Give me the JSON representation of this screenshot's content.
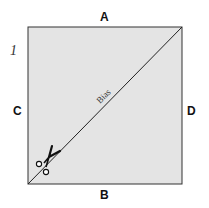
{
  "figure": {
    "number": "1",
    "edge_labels": {
      "top": "A",
      "bottom": "B",
      "left": "C",
      "right": "D"
    },
    "diagonal_label": "Bias",
    "icon": "scissors-icon",
    "colors": {
      "fabric": "#e4e4e4",
      "stroke": "#222222"
    }
  }
}
